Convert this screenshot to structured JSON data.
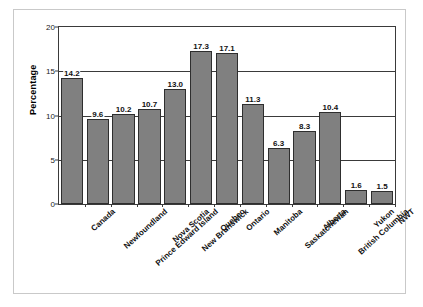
{
  "figure": {
    "frame_color": "#c9c9c9",
    "bar_color": "#808080",
    "bar_border_color": "#2e2e2e",
    "axis_color": "#3a3a3a"
  },
  "chart_data": {
    "type": "bar",
    "title": "",
    "xlabel": "",
    "ylabel": "Percentage",
    "ylim": [
      0,
      20
    ],
    "yticks": [
      0,
      5,
      10,
      15,
      20
    ],
    "ytick_labels": [
      "0",
      "5",
      "10",
      "15",
      "20"
    ],
    "grid": true,
    "legend": "none",
    "categories": [
      "Canada",
      "Newfoundland",
      "Prince Edward Island",
      "Nova Scotia",
      "New Brunswick",
      "Quebec",
      "Ontario",
      "Manitoba",
      "Saskatchewan",
      "Alberta",
      "British Columbia",
      "Yukon",
      "NWT"
    ],
    "values": [
      14.2,
      9.6,
      10.2,
      10.7,
      13.0,
      17.3,
      17.1,
      11.3,
      6.3,
      8.3,
      10.4,
      1.6,
      1.5
    ],
    "value_labels": [
      "14.2",
      "9.6",
      "10.2",
      "10.7",
      "13.0",
      "17.3",
      "17.1",
      "11.3",
      "6.3",
      "8.3",
      "10.4",
      "1.6",
      "1.5"
    ]
  }
}
